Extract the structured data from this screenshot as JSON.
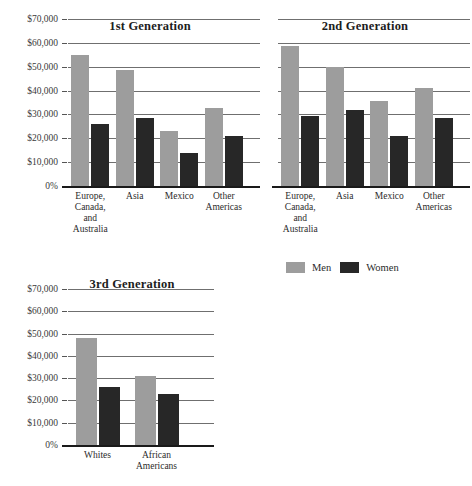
{
  "legend": {
    "position": "middle-right",
    "entries": [
      {
        "label": "Men",
        "color": "#9d9d9d",
        "swatch": "men-swatch"
      },
      {
        "label": "Women",
        "color": "#272727",
        "swatch": "women-swatch"
      }
    ]
  },
  "axis": {
    "ticks": [
      "$70,000",
      "$60,000",
      "$50,000",
      "$40,000",
      "$30,000",
      "$20,000",
      "$10,000",
      "0%"
    ],
    "tick_values": [
      70000,
      60000,
      50000,
      40000,
      30000,
      20000,
      10000,
      0
    ],
    "ymin": 0,
    "ymax": 70000
  },
  "chart_data": {
    "type": "bar",
    "title": "",
    "xlabel": "",
    "ylabel": "",
    "ylim": [
      0,
      70000
    ],
    "ytick_labels": [
      "0%",
      "$10,000",
      "$20,000",
      "$30,000",
      "$40,000",
      "$50,000",
      "$60,000",
      "$70,000"
    ],
    "grid": true,
    "legend": [
      "Men",
      "Women"
    ],
    "legend_position": "middle-right",
    "panels": [
      {
        "title": "1st Generation",
        "categories": [
          "Europe,\nCanada,\nand\nAustralia",
          "Asia",
          "Mexico",
          "Other\nAmericas"
        ],
        "category_lines": [
          [
            "Europe,",
            "Canada,",
            "and",
            "Australia"
          ],
          [
            "Asia"
          ],
          [
            "Mexico"
          ],
          [
            "Other",
            "Americas"
          ]
        ],
        "series": [
          {
            "name": "Men",
            "values": [
              55000,
              48500,
              23000,
              32500
            ]
          },
          {
            "name": "Women",
            "values": [
              26000,
              28500,
              14000,
              21000
            ]
          }
        ]
      },
      {
        "title": "2nd Generation",
        "categories": [
          "Europe,\nCanada,\nand\nAustralia",
          "Asia",
          "Mexico",
          "Other\nAmericas"
        ],
        "category_lines": [
          [
            "Europe,",
            "Canada,",
            "and",
            "Australia"
          ],
          [
            "Asia"
          ],
          [
            "Mexico"
          ],
          [
            "Other",
            "Americas"
          ]
        ],
        "series": [
          {
            "name": "Men",
            "values": [
              58500,
              50000,
              35500,
              41000
            ]
          },
          {
            "name": "Women",
            "values": [
              29500,
              32000,
              21000,
              28500
            ]
          }
        ]
      },
      {
        "title": "3rd Generation",
        "categories": [
          "Whites",
          "African\nAmericans"
        ],
        "category_lines": [
          [
            "Whites"
          ],
          [
            "African",
            "Americans"
          ]
        ],
        "series": [
          {
            "name": "Men",
            "values": [
              48000,
              31000
            ]
          },
          {
            "name": "Women",
            "values": [
              26000,
              23000
            ]
          }
        ]
      }
    ]
  }
}
